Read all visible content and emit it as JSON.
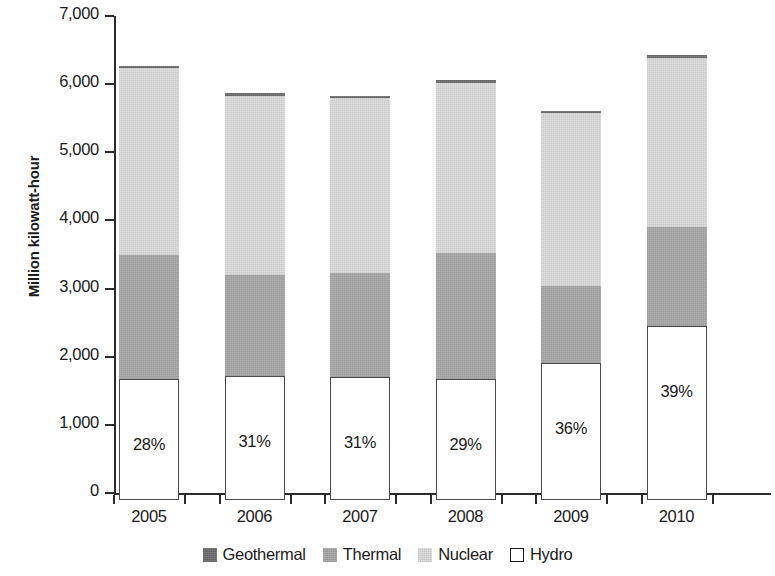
{
  "chart_data": {
    "type": "bar",
    "stacked": true,
    "title": "",
    "xlabel": "",
    "ylabel": "Million kilowatt-hour",
    "categories": [
      "2005",
      "2006",
      "2007",
      "2008",
      "2009",
      "2010"
    ],
    "ylim": [
      0,
      7000
    ],
    "ytick_values": [
      0,
      1000,
      2000,
      3000,
      4000,
      5000,
      6000,
      7000
    ],
    "ytick_labels": [
      "0",
      "1,000",
      "2,000",
      "3,000",
      "4,000",
      "5,000",
      "6,000",
      "7,000"
    ],
    "grid": false,
    "legend_position": "bottom",
    "series": [
      {
        "name": "Hydro",
        "color": "#ffffff",
        "values": [
          1780,
          1820,
          1810,
          1780,
          2010,
          2550
        ]
      },
      {
        "name": "Thermal",
        "color": "#a8a8a8",
        "values": [
          1820,
          1480,
          1520,
          1850,
          1130,
          1450
        ]
      },
      {
        "name": "Nuclear",
        "color": "#dcdcdc",
        "values": [
          2740,
          2640,
          2570,
          2500,
          2540,
          2500
        ]
      },
      {
        "name": "Geothermal",
        "color": "#6e6e6e",
        "values": [
          0,
          0,
          0,
          0,
          0,
          0
        ]
      }
    ],
    "totals": [
      6340,
      5940,
      5900,
      6130,
      5680,
      6500
    ],
    "data_labels": [
      "28%",
      "31%",
      "31%",
      "29%",
      "36%",
      "39%"
    ],
    "data_label_note": "Hydro share of total generation, printed inside the white Hydro segment"
  },
  "legend": {
    "items": [
      {
        "label": "Geothermal",
        "swatch": "geothermal"
      },
      {
        "label": "Thermal",
        "swatch": "thermal"
      },
      {
        "label": "Nuclear",
        "swatch": "nuclear"
      },
      {
        "label": "Hydro",
        "swatch": "hydro"
      }
    ]
  }
}
